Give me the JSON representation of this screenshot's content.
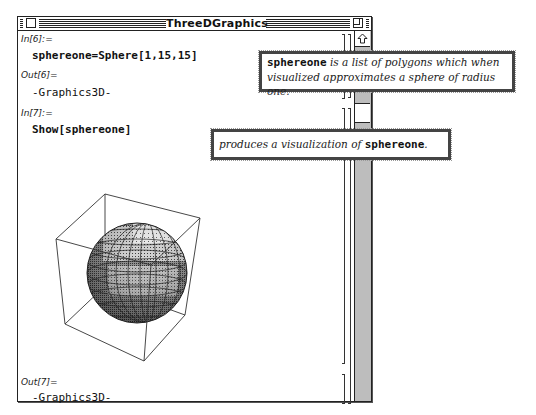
{
  "window": {
    "title": "ThreeDGraphics"
  },
  "cells": [
    {
      "in_label": "In[6]:=",
      "input": "sphereone=Sphere[1,15,15]"
    },
    {
      "out_label": "Out[6]=",
      "output": "-Graphics3D-"
    },
    {
      "in_label": "In[7]:=",
      "input": "Show[sphereone]"
    },
    {
      "out_label": "Out[7]=",
      "output": "-Graphics3D-"
    }
  ],
  "graphic": {
    "type": "3d-sphere-in-bounding-box",
    "description": "Shaded polygon sphere of radius one inside a 3D box"
  },
  "annotations": [
    {
      "term": "sphereone",
      "line1_rest": " is a list of polygons which when",
      "line2": "visualized approximates a sphere of radius one."
    },
    {
      "pre": "produces a visualization of ",
      "term": "sphereone",
      "post": "."
    }
  ],
  "scrollbar": {
    "up_arrow": "scroll-up-arrow",
    "thumb_position_px": 72
  },
  "colors": {
    "frame": "#222222",
    "background": "#ffffff",
    "scroll_track": "#bdbdbd"
  }
}
